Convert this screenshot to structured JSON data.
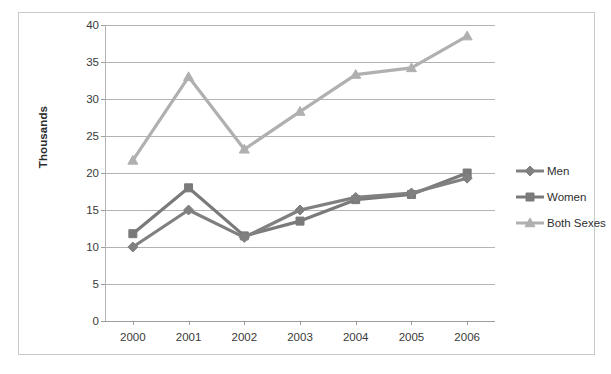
{
  "chart_data": {
    "type": "line",
    "title": "",
    "subtitle": "",
    "xlabel": "",
    "ylabel": "Thousands",
    "categories": [
      "2000",
      "2001",
      "2002",
      "2003",
      "2004",
      "2005",
      "2006"
    ],
    "ylim": [
      0,
      40
    ],
    "ytick_step": 5,
    "yticks": [
      0,
      5,
      10,
      15,
      20,
      25,
      30,
      35,
      40
    ],
    "grid": "horizontal",
    "legend_position": "right",
    "series": [
      {
        "name": "Men",
        "marker": "diamond",
        "color": "#808080",
        "values": [
          10.0,
          15.0,
          11.3,
          15.0,
          16.7,
          17.3,
          19.3
        ]
      },
      {
        "name": "Women",
        "marker": "square",
        "color": "#7a7a7a",
        "values": [
          11.8,
          18.0,
          11.5,
          13.5,
          16.4,
          17.1,
          20.0
        ]
      },
      {
        "name": "Both Sexes",
        "marker": "triangle",
        "color": "#b0b0b0",
        "values": [
          21.7,
          33.0,
          23.2,
          28.3,
          33.3,
          34.2,
          38.5
        ]
      }
    ]
  },
  "axis": {
    "y_title": "Thousands",
    "y_tick_labels": [
      "40",
      "35",
      "30",
      "25",
      "20",
      "15",
      "10",
      "5",
      "0"
    ],
    "x_tick_labels": [
      "2000",
      "2001",
      "2002",
      "2003",
      "2004",
      "2005",
      "2006"
    ]
  },
  "legend": {
    "items": [
      {
        "label": "Men",
        "color": "#808080",
        "marker": "diamond"
      },
      {
        "label": "Women",
        "color": "#7a7a7a",
        "marker": "square"
      },
      {
        "label": "Both Sexes",
        "color": "#b0b0b0",
        "marker": "triangle"
      }
    ]
  },
  "colors": {
    "frame_border": "#c9c9c9",
    "gridline": "#b3b3b3",
    "axis": "#9d9d9d",
    "text": "#3a3a3a",
    "background": "#ffffff"
  }
}
